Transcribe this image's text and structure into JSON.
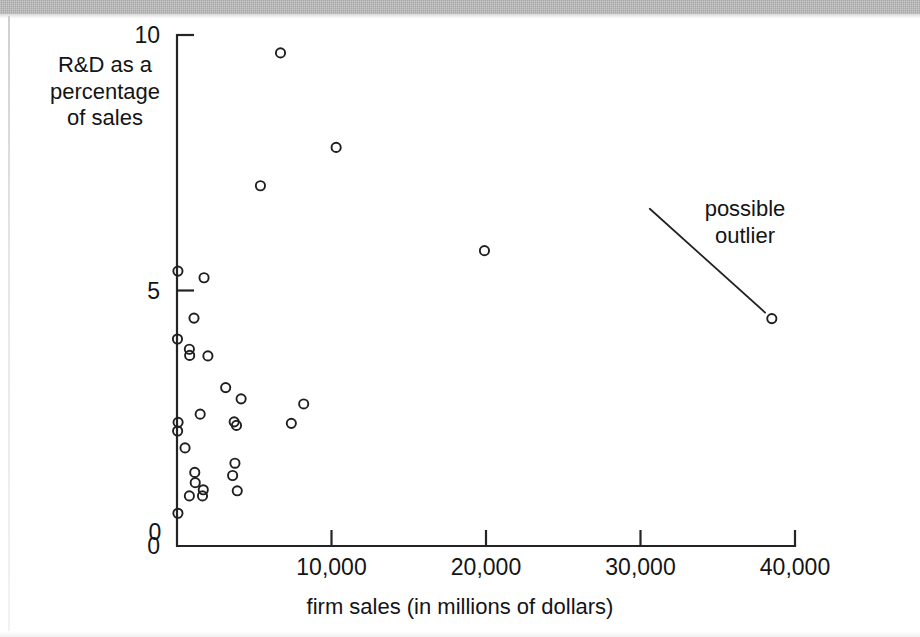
{
  "figure": {
    "background_color": "#ffffff",
    "ink_color": "#1f1f1f",
    "scan_band_color": "#a9a9a9"
  },
  "labels": {
    "y_axis_title_line1": "R&D as a",
    "y_axis_title_line2": "percentage",
    "y_axis_title_line3": "of sales",
    "x_axis_title": "firm sales (in millions of dollars)",
    "annotation_line1": "possible",
    "annotation_line2": "outlier"
  },
  "axes": {
    "x_ticks": [
      "0",
      "10,000",
      "20,000",
      "30,000",
      "40,000"
    ],
    "x_tick_values": [
      0,
      10000,
      20000,
      30000,
      40000
    ],
    "y_ticks": [
      "0",
      "5",
      "10"
    ],
    "y_tick_values": [
      0,
      5,
      10
    ]
  },
  "chart_data": {
    "type": "scatter",
    "title": "",
    "xlabel": "firm sales (in millions of dollars)",
    "ylabel": "R&D as a percentage of sales",
    "xlim": [
      0,
      41500
    ],
    "ylim": [
      0,
      10
    ],
    "grid": false,
    "legend": null,
    "marker": "open-circle",
    "annotations": [
      {
        "text": "possible outlier",
        "target_x": 38500,
        "target_y": 4.45,
        "label_x": 30600,
        "label_y": 6.6
      }
    ],
    "points": [
      {
        "x": 6700,
        "y": 9.65
      },
      {
        "x": 10300,
        "y": 7.8
      },
      {
        "x": 5400,
        "y": 7.05
      },
      {
        "x": 19900,
        "y": 5.78
      },
      {
        "x": 38500,
        "y": 4.45
      },
      {
        "x": 60,
        "y": 5.38
      },
      {
        "x": 1750,
        "y": 5.25
      },
      {
        "x": 1100,
        "y": 4.46
      },
      {
        "x": 30,
        "y": 4.05
      },
      {
        "x": 800,
        "y": 3.85
      },
      {
        "x": 820,
        "y": 3.73
      },
      {
        "x": 2000,
        "y": 3.72
      },
      {
        "x": 3150,
        "y": 3.1
      },
      {
        "x": 4150,
        "y": 2.88
      },
      {
        "x": 8200,
        "y": 2.78
      },
      {
        "x": 1500,
        "y": 2.58
      },
      {
        "x": 70,
        "y": 2.42
      },
      {
        "x": 40,
        "y": 2.25
      },
      {
        "x": 3700,
        "y": 2.43
      },
      {
        "x": 3850,
        "y": 2.36
      },
      {
        "x": 7400,
        "y": 2.4
      },
      {
        "x": 520,
        "y": 1.92
      },
      {
        "x": 3750,
        "y": 1.62
      },
      {
        "x": 3600,
        "y": 1.38
      },
      {
        "x": 1150,
        "y": 1.44
      },
      {
        "x": 1180,
        "y": 1.24
      },
      {
        "x": 1700,
        "y": 1.1
      },
      {
        "x": 3900,
        "y": 1.08
      },
      {
        "x": 800,
        "y": 0.98
      },
      {
        "x": 1650,
        "y": 0.98
      },
      {
        "x": 60,
        "y": 0.64
      }
    ]
  }
}
